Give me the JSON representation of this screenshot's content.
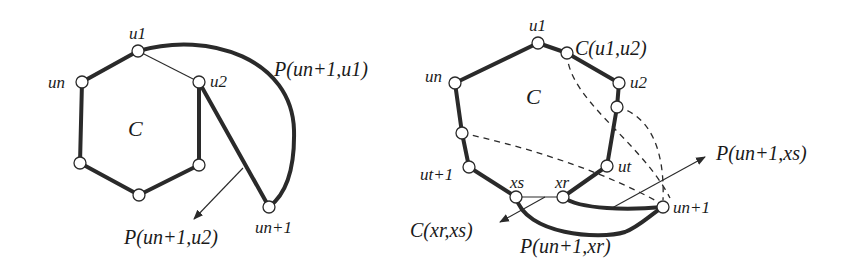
{
  "figure": {
    "background": "#ffffff",
    "ink": "#2a2a2a",
    "left_panel": {
      "cycle_label": "C",
      "node_labels": {
        "u1": "u1",
        "u2": "u2",
        "un": "un",
        "un1": "un+1"
      },
      "path_labels": {
        "p_un1_u1": "P(un+1,u1)",
        "p_un1_u2": "P(un+1,u2)"
      }
    },
    "right_panel": {
      "cycle_label": "C",
      "node_labels": {
        "u1": "u1",
        "u2": "u2",
        "un": "un",
        "ut": "ut",
        "ut1": "ut+1",
        "xs": "xs",
        "xr": "xr",
        "un1": "un+1"
      },
      "path_labels": {
        "c_u1_u2": "C(u1,u2)",
        "p_un1_xs": "P(un+1,xs)",
        "c_xr_xs": "C(xr,xs)",
        "p_un1_xr": "P(un+1,xr)"
      }
    }
  }
}
